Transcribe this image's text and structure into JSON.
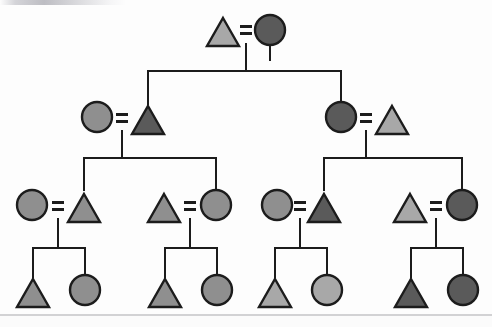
{
  "figure": {
    "type": "pedigree-chart",
    "title": "",
    "background_color": "#fdfdfd",
    "line_color": "#1c1c1c",
    "stroke_color": "#1c1c1c",
    "canvas": {
      "width": 492,
      "height": 327
    }
  },
  "legend": {
    "shape_meanings": {
      "triangle": "triangle-symbol",
      "circle": "circle-symbol",
      "equals": "mating-equals-sign"
    },
    "fills": {
      "light": "#a8a8a8",
      "medium": "#8f8f8f",
      "dark": "#5a5a5a"
    }
  },
  "generations": [
    {
      "id": "generation-1",
      "label": "I",
      "individuals": [
        {
          "id": "I-1",
          "shape": "triangle",
          "fill": "#a8a8a8",
          "tone": "light",
          "cx": 223,
          "cy": 32
        },
        {
          "id": "I-2",
          "shape": "circle",
          "fill": "#5a5a5a",
          "tone": "dark",
          "cx": 270,
          "cy": 30
        }
      ],
      "matings": [
        {
          "id": "mating-I-1",
          "left": "I-1",
          "right": "I-2",
          "x": 246,
          "y": 30
        }
      ]
    },
    {
      "id": "generation-2",
      "label": "II",
      "individuals": [
        {
          "id": "II-1",
          "shape": "circle",
          "fill": "#8f8f8f",
          "tone": "medium",
          "cx": 97,
          "cy": 117
        },
        {
          "id": "II-2",
          "shape": "triangle",
          "fill": "#5a5a5a",
          "tone": "dark",
          "cx": 148,
          "cy": 120
        },
        {
          "id": "II-3",
          "shape": "circle",
          "fill": "#5a5a5a",
          "tone": "dark",
          "cx": 341,
          "cy": 117
        },
        {
          "id": "II-4",
          "shape": "triangle",
          "fill": "#a8a8a8",
          "tone": "light",
          "cx": 392,
          "cy": 120
        }
      ],
      "matings": [
        {
          "id": "mating-II-1",
          "left": "II-1",
          "right": "II-2",
          "x": 122,
          "y": 118
        },
        {
          "id": "mating-II-2",
          "left": "II-3",
          "right": "II-4",
          "x": 366,
          "y": 118
        }
      ]
    },
    {
      "id": "generation-3",
      "label": "III",
      "individuals": [
        {
          "id": "III-1",
          "shape": "circle",
          "fill": "#8f8f8f",
          "tone": "medium",
          "cx": 32,
          "cy": 205
        },
        {
          "id": "III-2",
          "shape": "triangle",
          "fill": "#8f8f8f",
          "tone": "medium",
          "cx": 84,
          "cy": 208
        },
        {
          "id": "III-3",
          "shape": "triangle",
          "fill": "#8f8f8f",
          "tone": "medium",
          "cx": 164,
          "cy": 208
        },
        {
          "id": "III-4",
          "shape": "circle",
          "fill": "#8f8f8f",
          "tone": "medium",
          "cx": 216,
          "cy": 205
        },
        {
          "id": "III-5",
          "shape": "circle",
          "fill": "#8f8f8f",
          "tone": "medium",
          "cx": 277,
          "cy": 205
        },
        {
          "id": "III-6",
          "shape": "triangle",
          "fill": "#5a5a5a",
          "tone": "dark",
          "cx": 324,
          "cy": 208
        },
        {
          "id": "III-7",
          "shape": "triangle",
          "fill": "#a8a8a8",
          "tone": "light",
          "cx": 410,
          "cy": 208
        },
        {
          "id": "III-8",
          "shape": "circle",
          "fill": "#5a5a5a",
          "tone": "dark",
          "cx": 462,
          "cy": 205
        }
      ],
      "matings": [
        {
          "id": "mating-III-1",
          "left": "III-1",
          "right": "III-2",
          "x": 58,
          "y": 206
        },
        {
          "id": "mating-III-2",
          "left": "III-3",
          "right": "III-4",
          "x": 190,
          "y": 206
        },
        {
          "id": "mating-III-3",
          "left": "III-5",
          "right": "III-6",
          "x": 300,
          "y": 206
        },
        {
          "id": "mating-III-4",
          "left": "III-7",
          "right": "III-8",
          "x": 436,
          "y": 206
        }
      ]
    },
    {
      "id": "generation-4",
      "label": "IV",
      "individuals": [
        {
          "id": "IV-1",
          "shape": "triangle",
          "fill": "#8f8f8f",
          "tone": "medium",
          "cx": 33,
          "cy": 293
        },
        {
          "id": "IV-2",
          "shape": "circle",
          "fill": "#8f8f8f",
          "tone": "medium",
          "cx": 85,
          "cy": 290
        },
        {
          "id": "IV-3",
          "shape": "triangle",
          "fill": "#8f8f8f",
          "tone": "medium",
          "cx": 165,
          "cy": 293
        },
        {
          "id": "IV-4",
          "shape": "circle",
          "fill": "#8f8f8f",
          "tone": "medium",
          "cx": 217,
          "cy": 290
        },
        {
          "id": "IV-5",
          "shape": "triangle",
          "fill": "#a8a8a8",
          "tone": "light",
          "cx": 275,
          "cy": 293
        },
        {
          "id": "IV-6",
          "shape": "circle",
          "fill": "#a8a8a8",
          "tone": "light",
          "cx": 327,
          "cy": 290
        },
        {
          "id": "IV-7",
          "shape": "triangle",
          "fill": "#5a5a5a",
          "tone": "dark",
          "cx": 411,
          "cy": 293
        },
        {
          "id": "IV-8",
          "shape": "circle",
          "fill": "#5a5a5a",
          "tone": "dark",
          "cx": 463,
          "cy": 290
        }
      ],
      "matings": []
    }
  ],
  "sibships": [
    {
      "id": "sibship-1",
      "parent_x": 246,
      "drop_from": 44,
      "bar_y": 71,
      "bar_x1": 148,
      "bar_x2": 341,
      "children_y": 102
    },
    {
      "id": "sibship-2",
      "parent_x": 122,
      "drop_from": 131,
      "bar_y": 158,
      "bar_x1": 84,
      "bar_x2": 216,
      "children_y": 190
    },
    {
      "id": "sibship-3",
      "parent_x": 366,
      "drop_from": 131,
      "bar_y": 158,
      "bar_x1": 324,
      "bar_x2": 462,
      "children_y": 190
    },
    {
      "id": "sibship-4",
      "parent_x": 58,
      "drop_from": 219,
      "bar_y": 248,
      "bar_x1": 33,
      "bar_x2": 85,
      "children_y": 277
    },
    {
      "id": "sibship-5",
      "parent_x": 190,
      "drop_from": 219,
      "bar_y": 248,
      "bar_x1": 165,
      "bar_x2": 217,
      "children_y": 277
    },
    {
      "id": "sibship-6",
      "parent_x": 300,
      "drop_from": 219,
      "bar_y": 248,
      "bar_x1": 275,
      "bar_x2": 327,
      "children_y": 277
    },
    {
      "id": "sibship-7",
      "parent_x": 436,
      "drop_from": 219,
      "bar_y": 248,
      "bar_x1": 411,
      "bar_x2": 463,
      "children_y": 277
    }
  ],
  "top_links": [
    {
      "id": "link-I-2-down",
      "x": 270,
      "y1": 44,
      "y2": 60
    },
    {
      "id": "link-II-1-up",
      "x": 148,
      "y1": 71,
      "y2": 104
    },
    {
      "id": "link-II-3-up",
      "x": 341,
      "y1": 71,
      "y2": 102
    }
  ]
}
